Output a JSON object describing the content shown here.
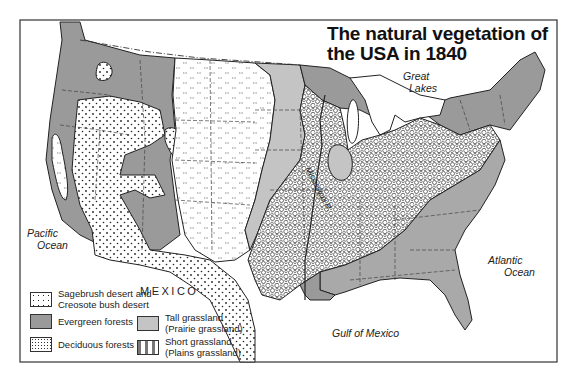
{
  "map": {
    "title_line1": "The natural vegetation of",
    "title_line2": "the USA in 1840",
    "labels": {
      "pacific_1": "Pacific",
      "pacific_2": "Ocean",
      "atlantic_1": "Atlantic",
      "atlantic_2": "Ocean",
      "gulf": "Gulf of Mexico",
      "great_lakes_1": "Great",
      "great_lakes_2": "Lakes",
      "mexico": "MEXICO",
      "river": "Mississippi R."
    },
    "colors": {
      "evergreen": "#9a9a9a",
      "tall_grassland": "#c4c4c4",
      "southeast_forest": "#a9a9a9",
      "water": "#ffffff",
      "border": "#222222"
    }
  },
  "legend": {
    "items": [
      {
        "key": "sagebrush",
        "line1": "Sagebrush desert and",
        "line2": "Creosote bush desert",
        "pattern": "dots"
      },
      {
        "key": "evergreen",
        "line1": "Evergreen forests",
        "line2": "",
        "pattern": "solid-dark-gray"
      },
      {
        "key": "deciduous",
        "line1": "Deciduous forests",
        "line2": "",
        "pattern": "circles"
      },
      {
        "key": "tall",
        "line1": "Tall grassland",
        "line2": "(Prairie grassland)",
        "pattern": "solid-light-gray"
      },
      {
        "key": "short",
        "line1": "Short grassland",
        "line2": "(Plains grassland)",
        "pattern": "hatch-marks"
      }
    ]
  }
}
